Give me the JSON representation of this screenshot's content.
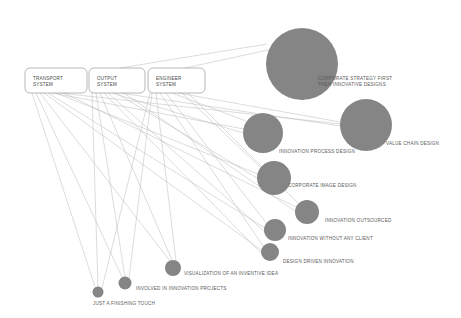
{
  "diagram": {
    "background_color": "#ffffff",
    "bubble_color": "#858585",
    "edge_color": "#b9b9b9",
    "box_stroke_color": "#9a9a9a",
    "system_nodes": [
      {
        "id": "transport-system",
        "line1": "TRANSPORT",
        "line2": "SYSTEM",
        "x": 25,
        "y": 68,
        "w": 62,
        "h": 25
      },
      {
        "id": "output-system",
        "line1": "OUTPUT",
        "line2": "SYSTEM",
        "x": 89,
        "y": 68,
        "w": 56,
        "h": 25
      },
      {
        "id": "engineer-system",
        "line1": "ENGINEER",
        "line2": "SYSTEM",
        "x": 148,
        "y": 68,
        "w": 57,
        "h": 25
      }
    ],
    "bubbles": [
      {
        "id": "corporate-strategy-first",
        "label_line1": "CORPORATE STRATEGY FIRST",
        "label_line2": "THEN INNOVATIVE DESIGNS",
        "cx": 302,
        "cy": 64,
        "r": 36,
        "label_x": 318,
        "label_y": 80
      },
      {
        "id": "value-chain-design",
        "label_line1": "VALUE CHAIN DESIGN",
        "label_line2": "",
        "cx": 366,
        "cy": 125,
        "r": 26,
        "label_x": 386,
        "label_y": 145
      },
      {
        "id": "innovation-process-design",
        "label_line1": "INNOVATION PROCESS DESIGN",
        "label_line2": "",
        "cx": 263,
        "cy": 133,
        "r": 20,
        "label_x": 279,
        "label_y": 153
      },
      {
        "id": "corporate-image-design",
        "label_line1": "CORPORATE IMAGE DESIGN",
        "label_line2": "",
        "cx": 274,
        "cy": 178,
        "r": 17,
        "label_x": 288,
        "label_y": 187
      },
      {
        "id": "innovation-outsourced",
        "label_line1": "INNOVATION OUTSOURCED",
        "label_line2": "",
        "cx": 307,
        "cy": 212,
        "r": 12,
        "label_x": 325,
        "label_y": 222
      },
      {
        "id": "innovation-without-any-client",
        "label_line1": "INNOVATION WITHOUT ANY CLIENT",
        "label_line2": "",
        "cx": 275,
        "cy": 230,
        "r": 11,
        "label_x": 288,
        "label_y": 240
      },
      {
        "id": "design-driven-innovation",
        "label_line1": "DESIGN DRIVEN INNOVATION",
        "label_line2": "",
        "cx": 270,
        "cy": 252,
        "r": 9,
        "label_x": 283,
        "label_y": 263
      },
      {
        "id": "visualization-of-an-inventive-idea",
        "label_line1": "VISUALIZATION OF AN INVENTIVE IDEA",
        "label_line2": "",
        "cx": 173,
        "cy": 268,
        "r": 8,
        "label_x": 184,
        "label_y": 275
      },
      {
        "id": "involved-in-innovation-projects",
        "label_line1": "INVOLVED IN INNOVATION PROJECTS",
        "label_line2": "",
        "cx": 125,
        "cy": 283,
        "r": 6.5,
        "label_x": 136,
        "label_y": 290
      },
      {
        "id": "just-a-finishing-touch",
        "label_line1": "JUST A FINISHING TOUCH",
        "label_line2": "",
        "cx": 98,
        "cy": 292,
        "r": 5.5,
        "label_x": 93,
        "label_y": 305
      }
    ],
    "edges": [
      {
        "from": "engineer-system",
        "to": "corporate-strategy-first",
        "x1": 185,
        "y1": 68,
        "x2": 268,
        "y2": 50
      },
      {
        "from": "output-system",
        "to": "corporate-strategy-first",
        "x1": 120,
        "y1": 68,
        "x2": 267,
        "y2": 44
      },
      {
        "from": "transport-system",
        "to": "value-chain-design",
        "x1": 60,
        "y1": 93,
        "x2": 341,
        "y2": 124
      },
      {
        "from": "output-system",
        "to": "value-chain-design",
        "x1": 120,
        "y1": 93,
        "x2": 341,
        "y2": 126
      },
      {
        "from": "engineer-system",
        "to": "value-chain-design",
        "x1": 178,
        "y1": 93,
        "x2": 340,
        "y2": 122
      },
      {
        "from": "transport-system",
        "to": "innovation-process-design",
        "x1": 52,
        "y1": 93,
        "x2": 244,
        "y2": 129
      },
      {
        "from": "output-system",
        "to": "innovation-process-design",
        "x1": 112,
        "y1": 93,
        "x2": 243,
        "y2": 133
      },
      {
        "from": "engineer-system",
        "to": "innovation-process-design",
        "x1": 172,
        "y1": 93,
        "x2": 246,
        "y2": 121
      },
      {
        "from": "transport-system",
        "to": "corporate-image-design",
        "x1": 56,
        "y1": 93,
        "x2": 258,
        "y2": 174
      },
      {
        "from": "output-system",
        "to": "corporate-image-design",
        "x1": 116,
        "y1": 93,
        "x2": 257,
        "y2": 178
      },
      {
        "from": "engineer-system",
        "to": "corporate-image-design",
        "x1": 182,
        "y1": 93,
        "x2": 261,
        "y2": 168
      },
      {
        "from": "transport-system",
        "to": "innovation-outsourced",
        "x1": 64,
        "y1": 93,
        "x2": 296,
        "y2": 207
      },
      {
        "from": "output-system",
        "to": "innovation-outsourced",
        "x1": 124,
        "y1": 93,
        "x2": 295,
        "y2": 211
      },
      {
        "from": "engineer-system",
        "to": "innovation-outsourced",
        "x1": 188,
        "y1": 93,
        "x2": 298,
        "y2": 203
      },
      {
        "from": "transport-system",
        "to": "innovation-without-any-client",
        "x1": 48,
        "y1": 93,
        "x2": 265,
        "y2": 228
      },
      {
        "from": "output-system",
        "to": "innovation-without-any-client",
        "x1": 108,
        "y1": 93,
        "x2": 264,
        "y2": 231
      },
      {
        "from": "engineer-system",
        "to": "innovation-without-any-client",
        "x1": 166,
        "y1": 93,
        "x2": 267,
        "y2": 224
      },
      {
        "from": "transport-system",
        "to": "design-driven-innovation",
        "x1": 44,
        "y1": 93,
        "x2": 261,
        "y2": 250
      },
      {
        "from": "output-system",
        "to": "design-driven-innovation",
        "x1": 104,
        "y1": 93,
        "x2": 261,
        "y2": 253
      },
      {
        "from": "engineer-system",
        "to": "design-driven-innovation",
        "x1": 160,
        "y1": 93,
        "x2": 263,
        "y2": 246
      },
      {
        "from": "transport-system",
        "to": "visualization-of-an-inventive-idea",
        "x1": 40,
        "y1": 93,
        "x2": 170,
        "y2": 261
      },
      {
        "from": "output-system",
        "to": "visualization-of-an-inventive-idea",
        "x1": 100,
        "y1": 93,
        "x2": 172,
        "y2": 260
      },
      {
        "from": "engineer-system",
        "to": "visualization-of-an-inventive-idea",
        "x1": 156,
        "y1": 93,
        "x2": 176,
        "y2": 261
      },
      {
        "from": "transport-system",
        "to": "involved-in-innovation-projects",
        "x1": 36,
        "y1": 93,
        "x2": 122,
        "y2": 277
      },
      {
        "from": "output-system",
        "to": "involved-in-innovation-projects",
        "x1": 96,
        "y1": 93,
        "x2": 125,
        "y2": 277
      },
      {
        "from": "engineer-system",
        "to": "involved-in-innovation-projects",
        "x1": 152,
        "y1": 93,
        "x2": 129,
        "y2": 278
      },
      {
        "from": "transport-system",
        "to": "just-a-finishing-touch",
        "x1": 32,
        "y1": 93,
        "x2": 95,
        "y2": 287
      },
      {
        "from": "output-system",
        "to": "just-a-finishing-touch",
        "x1": 92,
        "y1": 93,
        "x2": 98,
        "y2": 287
      },
      {
        "from": "engineer-system",
        "to": "just-a-finishing-touch",
        "x1": 150,
        "y1": 93,
        "x2": 102,
        "y2": 288
      }
    ]
  }
}
